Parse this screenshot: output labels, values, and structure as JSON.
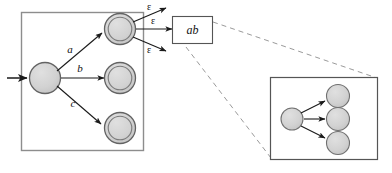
{
  "figure": {
    "colors": {
      "state_fill": "#d2d2d2",
      "state_stroke": "#555555",
      "box_stroke": "#777777",
      "arrow": "#1a1a1a",
      "dashed": "#8a8a8a",
      "text": "#111111",
      "background": "#ffffff"
    }
  },
  "main_machine": {
    "name": "main-automaton-box",
    "start_state": {
      "name": "start-state",
      "accepting": false
    },
    "states": [
      {
        "name": "state-top",
        "accepting": true
      },
      {
        "name": "state-middle",
        "accepting": true
      },
      {
        "name": "state-bottom",
        "accepting": true
      }
    ],
    "transitions": [
      {
        "name": "transition-a",
        "label": "a"
      },
      {
        "name": "transition-b",
        "label": "b"
      },
      {
        "name": "transition-c",
        "label": "c"
      }
    ]
  },
  "epsilon_transitions": {
    "name": "epsilon-transition-group",
    "labels": [
      "ε",
      "ε",
      "ε"
    ]
  },
  "ab_box": {
    "name": "ab-label-box",
    "label": "ab"
  },
  "inset": {
    "name": "inset-detail-box",
    "start_state": {
      "name": "inset-start-state"
    },
    "states": [
      {
        "name": "inset-state-top"
      },
      {
        "name": "inset-state-middle"
      },
      {
        "name": "inset-state-bottom"
      }
    ]
  }
}
